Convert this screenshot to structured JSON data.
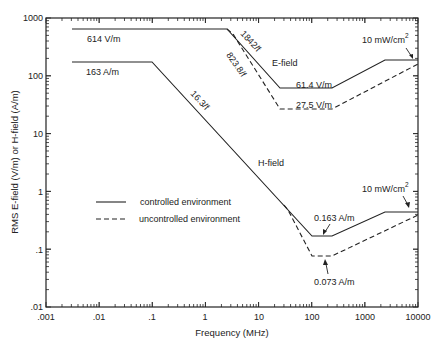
{
  "chart_data": {
    "type": "line",
    "title": "",
    "xlabel": "Frequency (MHz)",
    "ylabel": "RMS E-field (V/m) or H-field (A/m)",
    "xscale": "log",
    "yscale": "log",
    "xlim": [
      0.001,
      10000
    ],
    "ylim": [
      0.01,
      1000
    ],
    "x_ticks": [
      ".001",
      ".01",
      ".1",
      "1",
      "10",
      "100",
      "1000",
      "10000"
    ],
    "y_ticks": [
      "1000",
      "100",
      "10",
      "1",
      ".1",
      ".01"
    ],
    "grid": false,
    "legend": {
      "position": "center-left",
      "entries": [
        {
          "label": "controlled environment",
          "style": "solid"
        },
        {
          "label": "uncontrolled environment",
          "style": "dashed"
        }
      ]
    },
    "series": [
      {
        "name": "E-field controlled",
        "style": "solid",
        "x": [
          0.003,
          3,
          30,
          300,
          3000,
          10000
        ],
        "y": [
          614,
          614,
          61.4,
          61.4,
          194,
          194
        ]
      },
      {
        "name": "E-field uncontrolled",
        "style": "dashed",
        "x": [
          1.34,
          30,
          300,
          10000
        ],
        "y": [
          614,
          27.5,
          27.5,
          160
        ]
      },
      {
        "name": "H-field controlled",
        "style": "solid",
        "x": [
          0.003,
          0.1,
          100,
          300,
          3000,
          10000
        ],
        "y": [
          163,
          163,
          0.163,
          0.163,
          0.45,
          0.45
        ]
      },
      {
        "name": "H-field uncontrolled",
        "style": "dashed",
        "x": [
          30,
          100,
          300,
          10000
        ],
        "y": [
          0.5,
          0.073,
          0.073,
          0.4
        ]
      }
    ],
    "annotations": [
      {
        "text": "614 V/m"
      },
      {
        "text": "163 A/m"
      },
      {
        "text": "1842/f"
      },
      {
        "text": "823.8/f"
      },
      {
        "text": "E-field"
      },
      {
        "text": "61.4 V/m"
      },
      {
        "text": "27.5 V/m"
      },
      {
        "text": "16.3/f"
      },
      {
        "text": "H-field"
      },
      {
        "text": "10 mW/cm²",
        "target": "E-field plateau"
      },
      {
        "text": "10 mW/cm²",
        "target": "H-field plateau"
      },
      {
        "text": "0.163 A/m"
      },
      {
        "text": "0.073 A/m"
      }
    ]
  },
  "labels": {
    "e614": "614 V/m",
    "h163": "163 A/m",
    "e1842": "1842/f",
    "e823": "823.8/f",
    "efield": "E-field",
    "e614b": "61.4 V/m",
    "e275": "27.5 V/m",
    "h163f": "16.3/f",
    "hfield": "H-field",
    "mw_base": "10 mW/cm",
    "mw_sup": "2",
    "h0163": "0.163 A/m",
    "h0073": "0.073 A/m",
    "legend_controlled": "controlled environment",
    "legend_uncontrolled": "uncontrolled environment",
    "xlabel": "Frequency (MHz)",
    "ylabel": "RMS E-field (V/m) or H-field (A/m)"
  },
  "ticks": {
    "x": [
      ".001",
      ".01",
      ".1",
      "1",
      "10",
      "100",
      "1000",
      "10000"
    ],
    "y": [
      "1000",
      "100",
      "10",
      "1",
      ".1",
      ".01"
    ]
  }
}
